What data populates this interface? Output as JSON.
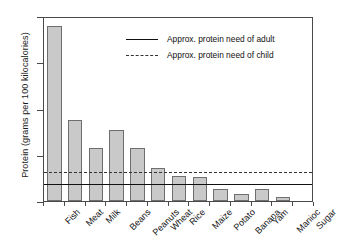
{
  "chart_data": {
    "type": "bar",
    "title": "",
    "subtitle": "",
    "xlabel": "",
    "ylabel": "Protein (grams per 100 kilocalories)",
    "categories": [
      "Fish",
      "Meat",
      "Milk",
      "Beans",
      "Peanuts",
      "Wheat",
      "Rice",
      "Maize",
      "Potato",
      "Banana",
      "Yam",
      "Manioc",
      "Sugar"
    ],
    "values": [
      18.9,
      8.8,
      5.7,
      7.7,
      5.7,
      3.6,
      2.7,
      2.6,
      1.25,
      0.8,
      1.25,
      0.4,
      0
    ],
    "series": [
      {
        "name": "Protein content",
        "values": [
          18.9,
          8.8,
          5.7,
          7.7,
          5.7,
          3.6,
          2.7,
          2.6,
          1.25,
          0.8,
          1.25,
          0.4,
          0
        ]
      }
    ],
    "ylim": [
      0,
      20
    ],
    "yticks": [
      0,
      5,
      10,
      15,
      20
    ],
    "ytick_labels": [
      "0",
      "5",
      "10",
      "15",
      "20"
    ],
    "grid": false,
    "legend_position": "top-center",
    "reference_lines": [
      {
        "name": "adult",
        "label": "Approx. protein need of adult",
        "value": 2.1,
        "style": "solid",
        "color": "#111111"
      },
      {
        "name": "child",
        "label": "Approx. protein need of child",
        "value": 3.3,
        "style": "dashed",
        "color": "#333333"
      }
    ],
    "bar_fill_color": "#c9c9c9",
    "bar_border_color": "#6e6e6e",
    "axis_color": "#4a4a4a"
  },
  "legend": {
    "items": [
      {
        "label": "Approx. protein need of adult",
        "style": "solid"
      },
      {
        "label": "Approx. protein need of child",
        "style": "dashed"
      }
    ]
  }
}
